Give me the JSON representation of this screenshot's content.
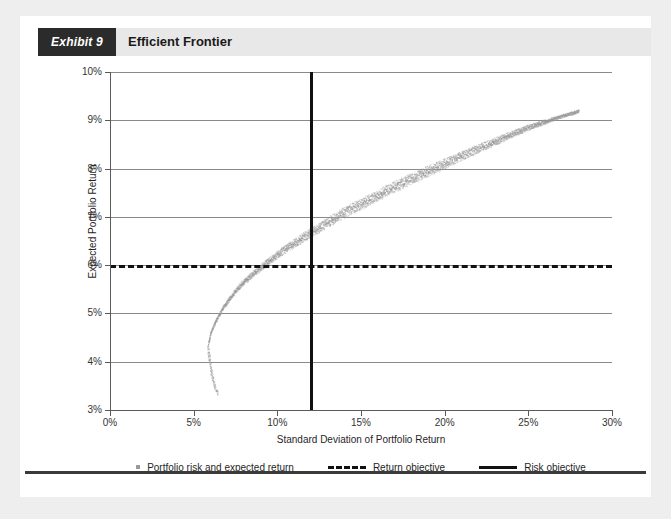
{
  "header": {
    "exhibit_tag": "Exhibit 9",
    "title": "Efficient Frontier"
  },
  "chart_data": {
    "type": "scatter",
    "title": "Efficient Frontier",
    "xlabel": "Standard Deviation of Portfolio Return",
    "ylabel": "Expected Portfolio Return",
    "xlim": [
      0,
      30
    ],
    "ylim": [
      3,
      10
    ],
    "x_ticks": [
      "0%",
      "5%",
      "10%",
      "15%",
      "20%",
      "25%",
      "30%"
    ],
    "x_tick_values": [
      0,
      5,
      10,
      15,
      20,
      25,
      30
    ],
    "y_ticks": [
      "3%",
      "4%",
      "5%",
      "6%",
      "7%",
      "8%",
      "9%",
      "10%"
    ],
    "y_tick_values": [
      3,
      4,
      5,
      6,
      7,
      8,
      9,
      10
    ],
    "grid": "horizontal",
    "legend_position": "bottom",
    "series": [
      {
        "name": "Portfolio risk and expected return",
        "type": "scatter",
        "color": "#9a9a9a",
        "marker": "square",
        "description": "Dense cloud of feasible portfolios forming the efficient frontier band",
        "frontier_points": [
          {
            "x": 5.85,
            "y": 4.35
          },
          {
            "x": 6.0,
            "y": 4.6
          },
          {
            "x": 6.3,
            "y": 4.85
          },
          {
            "x": 6.7,
            "y": 5.1
          },
          {
            "x": 7.2,
            "y": 5.35
          },
          {
            "x": 7.8,
            "y": 5.6
          },
          {
            "x": 8.6,
            "y": 5.85
          },
          {
            "x": 9.5,
            "y": 6.1
          },
          {
            "x": 10.5,
            "y": 6.35
          },
          {
            "x": 12.0,
            "y": 6.0
          },
          {
            "x": 11.6,
            "y": 6.6
          },
          {
            "x": 12.8,
            "y": 6.85
          },
          {
            "x": 14.0,
            "y": 7.1
          },
          {
            "x": 15.4,
            "y": 7.35
          },
          {
            "x": 16.8,
            "y": 7.6
          },
          {
            "x": 18.3,
            "y": 7.85
          },
          {
            "x": 19.9,
            "y": 8.1
          },
          {
            "x": 21.5,
            "y": 8.35
          },
          {
            "x": 23.2,
            "y": 8.6
          },
          {
            "x": 24.9,
            "y": 8.85
          },
          {
            "x": 26.6,
            "y": 9.05
          },
          {
            "x": 28.0,
            "y": 9.2
          }
        ],
        "lower_tail_points": [
          {
            "x": 5.85,
            "y": 4.3
          },
          {
            "x": 5.9,
            "y": 4.1
          },
          {
            "x": 6.0,
            "y": 3.9
          },
          {
            "x": 6.1,
            "y": 3.7
          },
          {
            "x": 6.25,
            "y": 3.5
          },
          {
            "x": 6.4,
            "y": 3.35
          }
        ],
        "min_variance_point": {
          "x": 5.85,
          "y": 4.35
        },
        "max_point": {
          "x": 28.0,
          "y": 9.2
        }
      },
      {
        "name": "Return objective",
        "type": "hline",
        "value": 6,
        "style": "dashed",
        "color": "#111111"
      },
      {
        "name": "Risk objective",
        "type": "vline",
        "value": 12,
        "style": "solid",
        "color": "#111111"
      }
    ],
    "legend": [
      "Portfolio risk and expected return",
      "Return objective",
      "Risk objective"
    ]
  }
}
